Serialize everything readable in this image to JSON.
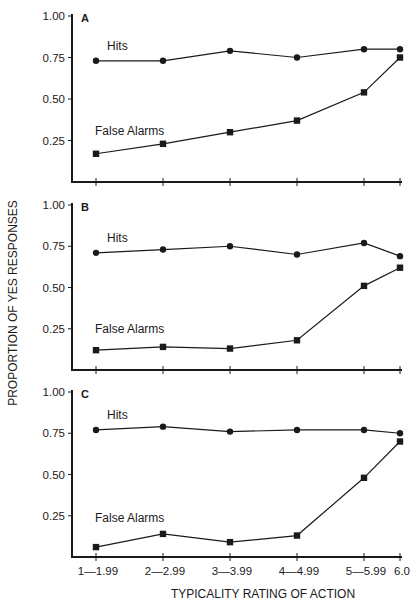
{
  "chart_data": [
    {
      "panel": "A",
      "type": "line",
      "categories": [
        "1—1.99",
        "2—2.99",
        "3—3.99",
        "4—4.99",
        "5—5.99",
        "6.0"
      ],
      "series": [
        {
          "name": "Hits",
          "marker": "circle",
          "values": [
            0.73,
            0.73,
            0.79,
            0.75,
            0.8,
            0.8
          ]
        },
        {
          "name": "False Alarms",
          "marker": "square",
          "values": [
            0.17,
            0.23,
            0.3,
            0.37,
            0.54,
            0.75
          ]
        }
      ],
      "yticks": [
        "1.00",
        "0.75",
        "0.50",
        "0.25"
      ],
      "ylim": [
        0,
        1
      ],
      "grid": false
    },
    {
      "panel": "B",
      "type": "line",
      "categories": [
        "1—1.99",
        "2—2.99",
        "3—3.99",
        "4—4.99",
        "5—5.99",
        "6.0"
      ],
      "series": [
        {
          "name": "Hits",
          "marker": "circle",
          "values": [
            0.71,
            0.73,
            0.75,
            0.7,
            0.77,
            0.69
          ]
        },
        {
          "name": "False Alarms",
          "marker": "square",
          "values": [
            0.12,
            0.14,
            0.13,
            0.18,
            0.51,
            0.62
          ]
        }
      ],
      "yticks": [
        "1.00",
        "0.75",
        "0.50",
        "0.25"
      ],
      "ylim": [
        0,
        1
      ],
      "grid": false
    },
    {
      "panel": "C",
      "type": "line",
      "categories": [
        "1—1.99",
        "2—2.99",
        "3—3.99",
        "4—4.99",
        "5—5.99",
        "6.0"
      ],
      "series": [
        {
          "name": "Hits",
          "marker": "circle",
          "values": [
            0.77,
            0.79,
            0.76,
            0.77,
            0.77,
            0.75
          ]
        },
        {
          "name": "False Alarms",
          "marker": "square",
          "values": [
            0.06,
            0.14,
            0.09,
            0.13,
            0.48,
            0.7
          ]
        }
      ],
      "yticks": [
        "1.00",
        "0.75",
        "0.50",
        "0.25"
      ],
      "ylim": [
        0,
        1
      ],
      "grid": false,
      "show_xtick_labels": true
    }
  ],
  "labels": {
    "ylabel": "PROPORTION OF YES RESPONSES",
    "xlabel": "TYPICALITY RATING OF ACTION",
    "hits_label": "Hits",
    "fa_label": "False Alarms"
  },
  "colors": {
    "ink": "#1a1a1a",
    "background": "#ffffff"
  }
}
